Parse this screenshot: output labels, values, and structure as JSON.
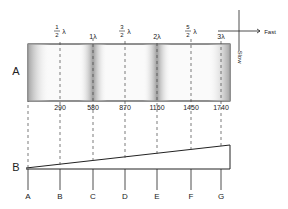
{
  "figure": {
    "orientation": "rotated-180",
    "wedge_label": "B",
    "plate_label": "A",
    "line_labels": [
      "A",
      "B",
      "C",
      "D",
      "E",
      "F",
      "G"
    ],
    "thickness_values": [
      "290",
      "580",
      "870",
      "1160",
      "1450",
      "1740"
    ],
    "wavelength_labels": [
      {
        "num": "1",
        "den": "2",
        "suffix": "λ"
      },
      {
        "text": "1λ"
      },
      {
        "num": "3",
        "den": "2",
        "suffix": "λ"
      },
      {
        "text": "2λ"
      },
      {
        "num": "5",
        "den": "2",
        "suffix": "λ"
      },
      {
        "text": "3λ"
      }
    ],
    "axis": {
      "slow_label": "Slow",
      "fast_label": "Fast"
    },
    "colors": {
      "line": "#222222",
      "band": "#9a9a9a",
      "plate_bg": "#f4f4f4"
    }
  }
}
